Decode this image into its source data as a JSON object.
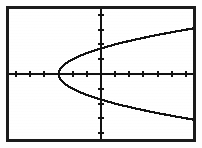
{
  "screen": {
    "device": "graphing-calculator-screen",
    "frame_color": "#1a1a1a",
    "background_color": "#ffffff",
    "curve_color": "#111111",
    "axis_color": "#111111",
    "width_px": 202,
    "height_px": 148
  },
  "chart_data": {
    "type": "line",
    "title": "",
    "subtitle": "",
    "xlabel": "",
    "ylabel": "",
    "equation": "x = y^2 - 3",
    "orientation": "parabola opening right",
    "vertex": [
      -3,
      0
    ],
    "x_axis_intercept": [
      -2,
      0
    ],
    "y_axis_intercepts": [
      [
        0,
        1.73
      ],
      [
        0,
        -1.73
      ]
    ],
    "grid": false,
    "legend": null,
    "legend_position": "none",
    "xlim": [
      -6.5,
      6.5
    ],
    "ylim": [
      -4.4,
      4.4
    ],
    "xtick_step": 1,
    "ytick_step": 1,
    "xticks": [
      -6,
      -5,
      -4,
      -3,
      -2,
      -1,
      1,
      2,
      3,
      4,
      5,
      6
    ],
    "yticks": [
      -4,
      -3,
      -2,
      -1,
      1,
      2,
      3,
      4
    ],
    "tick_labels_shown": false,
    "series": [
      {
        "name": "upper-branch",
        "comment": "y >= 0 branch of x = y^2 - 3",
        "x": [
          -3.0,
          -2.99,
          -2.96,
          -2.91,
          -2.84,
          -2.75,
          -2.64,
          -2.51,
          -2.36,
          -2.19,
          -2.0,
          -1.79,
          -1.56,
          -1.31,
          -1.04,
          -0.75,
          -0.44,
          -0.11,
          0.24,
          0.61,
          1.0,
          1.41,
          1.84,
          2.29,
          2.76,
          3.25,
          3.76,
          4.29,
          4.84,
          5.41,
          6.0,
          6.5
        ],
        "y": [
          0.0,
          0.1,
          0.2,
          0.3,
          0.4,
          0.5,
          0.6,
          0.7,
          0.8,
          0.9,
          1.0,
          1.1,
          1.2,
          1.3,
          1.4,
          1.5,
          1.6,
          1.7,
          1.8,
          1.9,
          2.0,
          2.1,
          2.2,
          2.3,
          2.4,
          2.5,
          2.6,
          2.7,
          2.8,
          2.9,
          3.0,
          3.08
        ]
      },
      {
        "name": "lower-branch",
        "comment": "y <= 0 branch of x = y^2 - 3",
        "x": [
          -3.0,
          -2.99,
          -2.96,
          -2.91,
          -2.84,
          -2.75,
          -2.64,
          -2.51,
          -2.36,
          -2.19,
          -2.0,
          -1.79,
          -1.56,
          -1.31,
          -1.04,
          -0.75,
          -0.44,
          -0.11,
          0.24,
          0.61,
          1.0,
          1.41,
          1.84,
          2.29,
          2.76,
          3.25,
          3.76,
          4.29,
          4.84,
          5.41,
          6.0,
          6.5
        ],
        "y": [
          0.0,
          -0.1,
          -0.2,
          -0.3,
          -0.4,
          -0.5,
          -0.6,
          -0.7,
          -0.8,
          -0.9,
          -1.0,
          -1.1,
          -1.2,
          -1.3,
          -1.4,
          -1.5,
          -1.6,
          -1.7,
          -1.8,
          -1.9,
          -2.0,
          -2.1,
          -2.2,
          -2.3,
          -2.4,
          -2.5,
          -2.6,
          -2.7,
          -2.8,
          -2.9,
          -3.0,
          -3.08
        ]
      }
    ]
  }
}
